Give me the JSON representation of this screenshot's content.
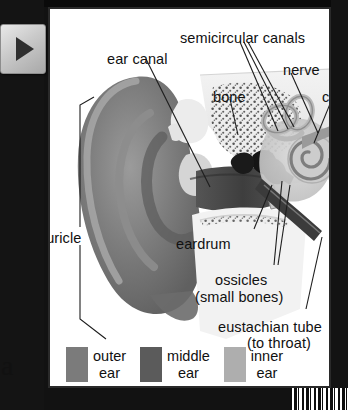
{
  "nav": {
    "next_button_icon": "play-triangle-right-icon",
    "next_button_label": ""
  },
  "stray_text": "a",
  "figure": {
    "labels": [
      {
        "id": "ear-canal",
        "text": "ear canal",
        "x": 57,
        "y": 42,
        "align": "left"
      },
      {
        "id": "semicircular",
        "text": "semicircular canals",
        "x": 130,
        "y": 21,
        "align": "left"
      },
      {
        "id": "nerve",
        "text": "nerve",
        "x": 233,
        "y": 53,
        "align": "left"
      },
      {
        "id": "bone",
        "text": "bone",
        "x": 163,
        "y": 80,
        "align": "left"
      },
      {
        "id": "cochlea",
        "text": "cochlea",
        "x": 275,
        "y": 80,
        "align": "left"
      },
      {
        "id": "auricle",
        "text": "auricle",
        "x": 34,
        "y": 221,
        "align": "left"
      },
      {
        "id": "eardrum",
        "text": "eardrum",
        "x": 174,
        "y": 227,
        "align": "left"
      },
      {
        "id": "ossicles",
        "text": "ossicles",
        "x": 213,
        "y": 263,
        "align": "left"
      },
      {
        "id": "ossicles-sub",
        "text": "(small bones)",
        "x": 193,
        "y": 280,
        "align": "left"
      },
      {
        "id": "eustachian",
        "text": "eustachian tube",
        "x": 216,
        "y": 310,
        "align": "left"
      },
      {
        "id": "eustachian-sub",
        "text": "(to throat)",
        "x": 245,
        "y": 326,
        "align": "left"
      }
    ]
  },
  "legend": {
    "items": [
      {
        "id": "outer-ear",
        "line1": "outer",
        "line2": "ear",
        "color": "#7b7b7b"
      },
      {
        "id": "middle-ear",
        "line1": "middle",
        "line2": "ear",
        "color": "#5b5b5b"
      },
      {
        "id": "inner-ear",
        "line1": "inner",
        "line2": "ear",
        "color": "#aeaeae"
      }
    ]
  },
  "colors": {
    "page_background": "#ffffff",
    "chrome_background": "#121212",
    "page_border": "#2a2a2a",
    "label_text": "#111111",
    "leader_line": "#222222",
    "auricle_dark": "#6f6f6f",
    "auricle_mid": "#8e8e8e",
    "canal_dark": "#4a4a4a",
    "bone_light": "#e8e8e8",
    "inner_ear_light": "#cfcfcf",
    "ossicles_black": "#1a1a1a"
  }
}
